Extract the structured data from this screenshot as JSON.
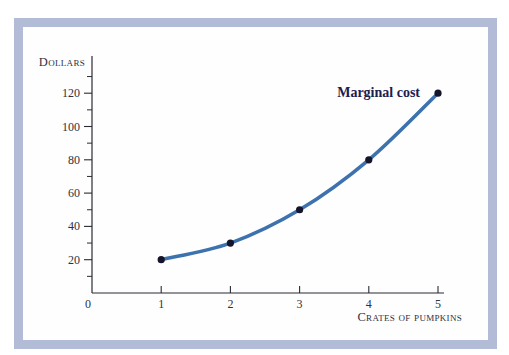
{
  "figure": {
    "frame_color": "#b3bcd6",
    "panel_color": "#fefefe",
    "page_background": "#ffffff"
  },
  "chart_data": {
    "type": "line",
    "title": "",
    "xlabel": "Crates of pumpkins",
    "ylabel": "Dollars",
    "x": [
      1,
      2,
      3,
      4,
      5
    ],
    "series": [
      {
        "name": "Marginal cost",
        "values": [
          20,
          30,
          50,
          80,
          120
        ]
      }
    ],
    "x_ticks": [
      0,
      1,
      2,
      3,
      4,
      5
    ],
    "y_ticks_major": [
      20,
      40,
      60,
      80,
      100,
      120
    ],
    "y_ticks_minor": [
      10,
      30,
      50,
      70,
      90,
      110,
      130
    ],
    "xlim": [
      0,
      5
    ],
    "ylim": [
      0,
      140
    ],
    "grid": false,
    "legend": "inline-label-near-line-end",
    "line_color": "#3d72ae",
    "point_color": "#14142a",
    "axis_color": "#2b2b33",
    "label_color": "#2e3144",
    "series_label_color": "#1b2050"
  }
}
